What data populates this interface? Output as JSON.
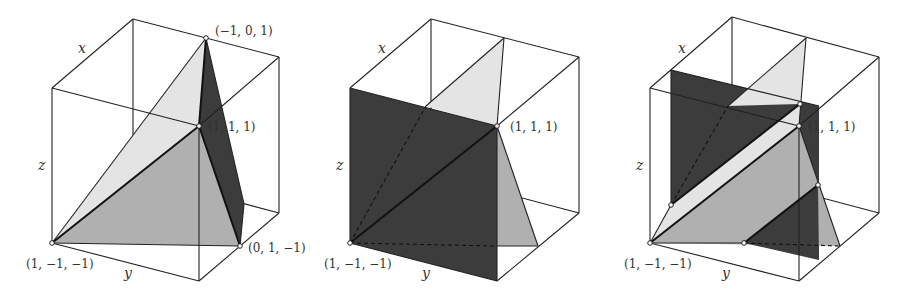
{
  "colors": {
    "light": "#e4e4e4",
    "mid": "#b0b0b0",
    "dark": "#3c3c3c",
    "edge": "#222222"
  },
  "panels": [
    {
      "id": "panel-1",
      "axes": {
        "x": "x",
        "y": "y",
        "z": "z"
      },
      "points": [
        {
          "label": "(−1, 0, 1)"
        },
        {
          "label": "(1, 1, 1)"
        },
        {
          "label": "(1, −1, −1)"
        },
        {
          "label": "(0, 1, −1)"
        }
      ]
    },
    {
      "id": "panel-2",
      "axes": {
        "x": "x",
        "y": "y",
        "z": "z"
      },
      "points": [
        {
          "label": "(1, 1, 1)"
        },
        {
          "label": "(1, −1, −1)"
        }
      ]
    },
    {
      "id": "panel-3",
      "axes": {
        "x": "x",
        "y": "y",
        "z": "z"
      },
      "points": [
        {
          "label": "(1, 1, 1)"
        },
        {
          "label": "(1, −1, −1)"
        }
      ]
    }
  ]
}
